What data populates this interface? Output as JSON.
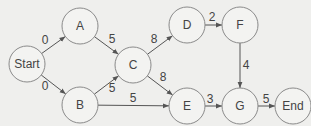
{
  "diagram": {
    "type": "network-graph",
    "nodes": [
      {
        "id": "Start",
        "label": "Start",
        "x": 27,
        "y": 64
      },
      {
        "id": "A",
        "label": "A",
        "x": 80,
        "y": 26
      },
      {
        "id": "B",
        "label": "B",
        "x": 80,
        "y": 105
      },
      {
        "id": "C",
        "label": "C",
        "x": 133,
        "y": 65
      },
      {
        "id": "D",
        "label": "D",
        "x": 187,
        "y": 25
      },
      {
        "id": "F",
        "label": "F",
        "x": 240,
        "y": 25
      },
      {
        "id": "E",
        "label": "E",
        "x": 187,
        "y": 106
      },
      {
        "id": "G",
        "label": "G",
        "x": 240,
        "y": 106
      },
      {
        "id": "End",
        "label": "End",
        "x": 293,
        "y": 106
      }
    ],
    "edges": [
      {
        "from": "Start",
        "to": "A",
        "weight": "0",
        "lx": 45,
        "ly": 40
      },
      {
        "from": "Start",
        "to": "B",
        "weight": "0",
        "lx": 45,
        "ly": 86
      },
      {
        "from": "A",
        "to": "C",
        "weight": "5",
        "lx": 112,
        "ly": 39
      },
      {
        "from": "B",
        "to": "C",
        "weight": "5",
        "lx": 112,
        "ly": 88
      },
      {
        "from": "B",
        "to": "E",
        "weight": "5",
        "lx": 133,
        "ly": 98
      },
      {
        "from": "C",
        "to": "D",
        "weight": "8",
        "lx": 154,
        "ly": 39
      },
      {
        "from": "C",
        "to": "E",
        "weight": "8",
        "lx": 163,
        "ly": 77
      },
      {
        "from": "D",
        "to": "F",
        "weight": "2",
        "lx": 212,
        "ly": 17
      },
      {
        "from": "F",
        "to": "G",
        "weight": "4",
        "lx": 246,
        "ly": 65
      },
      {
        "from": "E",
        "to": "G",
        "weight": "3",
        "lx": 210,
        "ly": 99
      },
      {
        "from": "G",
        "to": "End",
        "weight": "5",
        "lx": 266,
        "ly": 99
      }
    ]
  }
}
